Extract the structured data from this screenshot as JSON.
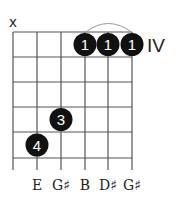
{
  "diagram": {
    "type": "guitar-chord-diagram",
    "position_label": "IV",
    "muted_strings": [
      {
        "string": 1,
        "symbol": "x"
      }
    ],
    "grid": {
      "strings": 6,
      "frets_shown": 5,
      "string_x": [
        13,
        37,
        61,
        85,
        108,
        132
      ],
      "fret_y": [
        32,
        57,
        82,
        107,
        132,
        158
      ],
      "string_bottom": 170,
      "line_color": "#555555"
    },
    "dots": [
      {
        "string": 4,
        "fret": 1,
        "finger": "1"
      },
      {
        "string": 5,
        "fret": 1,
        "finger": "1"
      },
      {
        "string": 6,
        "fret": 1,
        "finger": "1"
      },
      {
        "string": 3,
        "fret": 4,
        "finger": "3"
      },
      {
        "string": 2,
        "fret": 5,
        "finger": "4"
      }
    ],
    "barre": {
      "from_string": 4,
      "to_string": 6,
      "fret": 1
    },
    "notes": [
      {
        "string": 2,
        "label": "E"
      },
      {
        "string": 3,
        "label": "G♯"
      },
      {
        "string": 4,
        "label": "B"
      },
      {
        "string": 5,
        "label": "D♯"
      },
      {
        "string": 6,
        "label": "G♯"
      }
    ],
    "dot_color": "#111111",
    "dot_text_color": "#ffffff"
  }
}
